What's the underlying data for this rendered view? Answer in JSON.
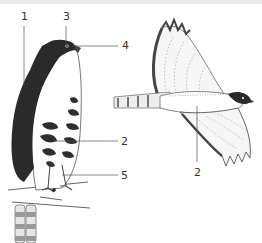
{
  "figure": {
    "colors": {
      "ink": "#333333",
      "dark_plumage": "#2a2a2a",
      "mid_plumage": "#8a8a8a",
      "light_plumage": "#d9d9d9",
      "background": "#ffffff",
      "top_band": "#ececec"
    },
    "perched_bird": {
      "labels": [
        {
          "id": "1",
          "text": "1",
          "x": 21,
          "y": 11
        },
        {
          "id": "3",
          "text": "3",
          "x": 63,
          "y": 11
        },
        {
          "id": "4",
          "text": "4",
          "x": 122,
          "y": 40
        },
        {
          "id": "2",
          "text": "2",
          "x": 121,
          "y": 136
        },
        {
          "id": "5",
          "text": "5",
          "x": 121,
          "y": 170
        }
      ]
    },
    "flying_bird": {
      "labels": [
        {
          "id": "2",
          "text": "2",
          "x": 194,
          "y": 167
        }
      ]
    }
  }
}
